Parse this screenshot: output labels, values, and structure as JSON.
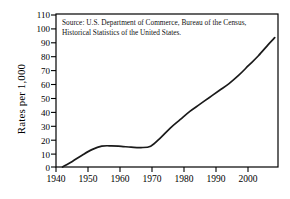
{
  "chart_data": {
    "type": "line",
    "title": "",
    "xlabel": "",
    "ylabel": "Rates per 1,000",
    "xlim": [
      1938,
      2006
    ],
    "ylim": [
      0,
      110
    ],
    "grid": false,
    "legend": null,
    "annotations": [
      "Source: U.S. Department of Commerce, Bureau of the Census, Historical Statistics of the United States."
    ],
    "xticks": [
      1940,
      1950,
      1960,
      1970,
      1980,
      1990,
      2000
    ],
    "yticks": [
      0,
      10,
      20,
      30,
      40,
      50,
      60,
      70,
      80,
      90,
      100,
      110
    ],
    "series": [
      {
        "name": "Rates per 1,000",
        "x": [
          1940,
          1943,
          1946,
          1949,
          1952,
          1955,
          1958,
          1961,
          1964,
          1967,
          1970,
          1973,
          1976,
          1979,
          1982,
          1985,
          1988,
          1991,
          1994,
          1997,
          2000,
          2003,
          2005
        ],
        "values": [
          0,
          4,
          8.5,
          12.5,
          15,
          15.2,
          14.8,
          14.3,
          14,
          15,
          21,
          28,
          34,
          40,
          45,
          50,
          55,
          60,
          66,
          73,
          80,
          88,
          93
        ]
      }
    ]
  },
  "axis": {
    "y_title": "Rates per 1,000",
    "y_tick_labels": [
      "110",
      "100",
      "90",
      "80",
      "70",
      "60",
      "50",
      "40",
      "30",
      "20",
      "10",
      "0"
    ],
    "x_tick_labels": [
      "1940",
      "1950",
      "1960",
      "1970",
      "1980",
      "1990",
      "2000"
    ]
  },
  "source_note": {
    "text": "Source: U.S. Department of Commerce, Bureau of the Census, Historical Statistics of the United States."
  },
  "colors": {
    "line": "#1a1a1a",
    "frame": "#000000",
    "background": "#ffffff",
    "text": "#000000"
  }
}
